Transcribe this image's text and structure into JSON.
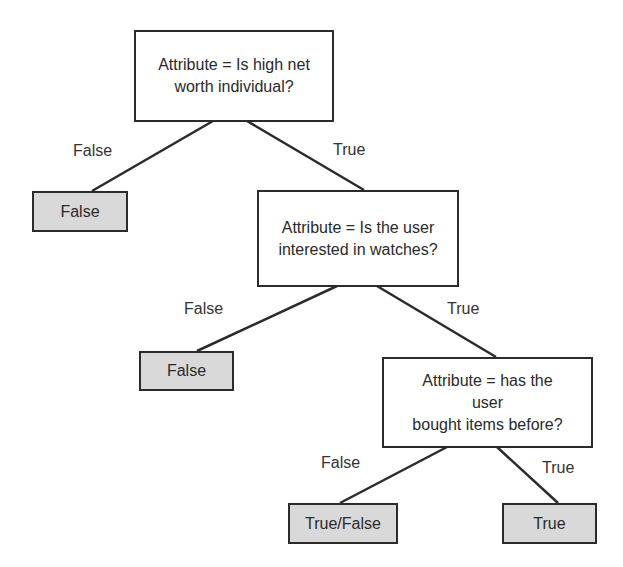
{
  "diagram": {
    "type": "decision-tree",
    "nodes": {
      "root": {
        "text": "Attribute = Is high net worth individual?",
        "line1": "Attribute = Is high net",
        "line2": "worth individual?"
      },
      "node2": {
        "line1": "Attribute = Is the user",
        "line2": "interested in watches?"
      },
      "node3": {
        "line1": "Attribute = has the",
        "line2": "user",
        "line3": "bought items before?"
      },
      "leaf1": {
        "text": "False"
      },
      "leaf2": {
        "text": "False"
      },
      "leaf3": {
        "text": "True/False"
      },
      "leaf4": {
        "text": "True"
      }
    },
    "edges": {
      "root_false": "False",
      "root_true": "True",
      "node2_false": "False",
      "node2_true": "True",
      "node3_false": "False",
      "node3_true": "True"
    },
    "colors": {
      "decision_fill": "#ffffff",
      "leaf_fill": "#d9d9d9",
      "stroke": "#2b2b2b"
    }
  }
}
